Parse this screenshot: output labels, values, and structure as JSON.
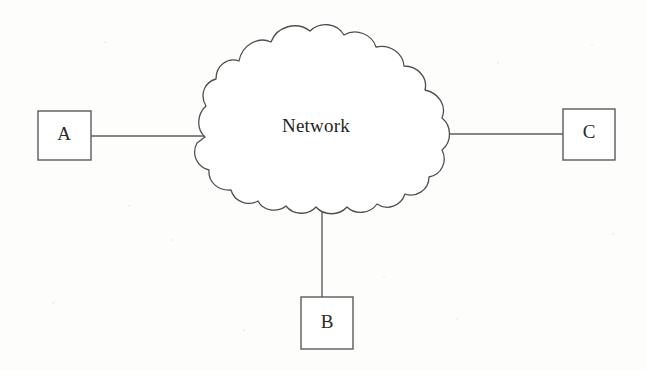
{
  "figure": {
    "type": "network-topology-diagram",
    "background_color": "#fdfdfc",
    "stroke_color": "#5a5a5a",
    "text_color": "#2b2b2b",
    "width": 647,
    "height": 371
  },
  "cloud": {
    "label": "Network",
    "label_x": 316,
    "label_y": 128,
    "center_x": 322,
    "center_y": 117,
    "left_x": 202,
    "right_x": 443,
    "top_y": 24,
    "bottom_y": 211
  },
  "nodes": [
    {
      "id": "A",
      "label": "A",
      "x": 38,
      "y": 111,
      "width": 53,
      "height": 49,
      "label_x": 64,
      "label_y": 136
    },
    {
      "id": "B",
      "label": "B",
      "x": 301,
      "y": 297,
      "width": 52,
      "height": 52,
      "label_x": 327,
      "label_y": 324
    },
    {
      "id": "C",
      "label": "C",
      "x": 563,
      "y": 109,
      "width": 52,
      "height": 51,
      "label_x": 589,
      "label_y": 134
    }
  ],
  "links": [
    {
      "id": "link-a-network",
      "from": "A",
      "to": "Network",
      "x1": 91,
      "y1": 136,
      "x2": 205,
      "y2": 136
    },
    {
      "id": "link-network-c",
      "from": "Network",
      "to": "C",
      "x1": 442,
      "y1": 134,
      "x2": 563,
      "y2": 134
    },
    {
      "id": "link-network-b",
      "from": "Network",
      "to": "B",
      "x1": 322,
      "y1": 212,
      "x2": 322,
      "y2": 297
    }
  ],
  "cloud_path": "M 205 137 C 196 129 197 114 206 106 C 199 94 205 82 216 79 C 216 65 228 57 239 61 C 242 45 258 36 271 42 C 277 26 297 21 310 31 C 320 21 337 23 344 35 C 356 28 372 34 376 47 C 390 44 403 53 404 66 C 418 66 428 78 425 90 C 439 93 447 106 442 118 C 452 126 452 142 442 150 C 448 162 441 175 429 177 C 429 190 416 198 405 194 C 401 206 387 211 377 204 C 370 214 355 215 347 207 C 339 216 324 216 316 207 C 308 216 293 215 286 206 C 277 213 263 211 258 201 C 247 207 234 201 231 190 C 218 191 208 182 209 170 C 197 167 191 154 197 143 C 200 141 202 139 205 137 Z",
  "noise_specks": [
    {
      "x": 104,
      "y": 41,
      "size": 2
    },
    {
      "x": 171,
      "y": 239,
      "size": 2
    },
    {
      "x": 456,
      "y": 318,
      "size": 2
    },
    {
      "x": 497,
      "y": 62,
      "size": 2
    },
    {
      "x": 612,
      "y": 233,
      "size": 2
    },
    {
      "x": 52,
      "y": 302,
      "size": 2
    },
    {
      "x": 243,
      "y": 329,
      "size": 2
    },
    {
      "x": 591,
      "y": 44,
      "size": 2
    },
    {
      "x": 128,
      "y": 205,
      "size": 2
    },
    {
      "x": 383,
      "y": 276,
      "size": 2
    }
  ]
}
